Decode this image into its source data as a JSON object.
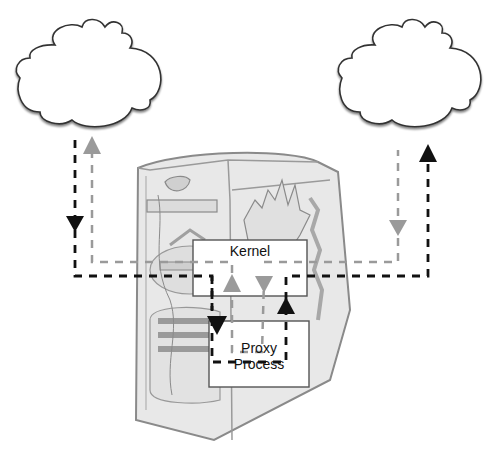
{
  "diagram": {
    "kernel_box": {
      "label": "Kernel"
    },
    "proxy_box": {
      "label_line1": "Proxy",
      "label_line2": "Process"
    },
    "nodes": [
      {
        "id": "cloud-left",
        "type": "cloud"
      },
      {
        "id": "cloud-right",
        "type": "cloud"
      },
      {
        "id": "server",
        "type": "computer-tower"
      }
    ],
    "colors": {
      "black_path": "#111111",
      "gray_path": "#9a9a9a",
      "box_border": "#555555",
      "box_fill": "#ffffff",
      "tower_fill": "#e6e6e6",
      "tower_stroke": "#8a8a8a"
    }
  }
}
